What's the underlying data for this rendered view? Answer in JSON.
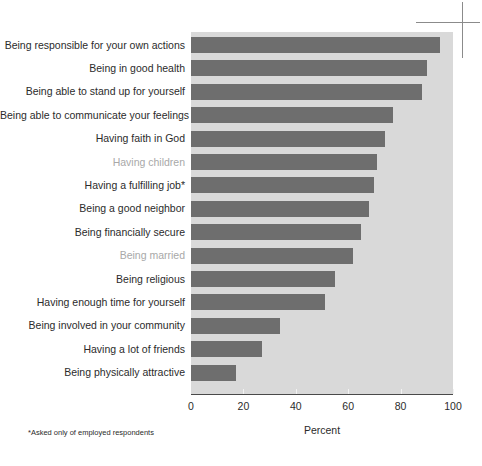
{
  "figure": {
    "x_axis_title": "Percent",
    "footnote": "*Asked only of employed respondents"
  },
  "chart_data": {
    "type": "bar",
    "orientation": "horizontal",
    "title": "",
    "subtitle": "",
    "xlabel": "Percent",
    "ylabel": "",
    "xlim": [
      0,
      100
    ],
    "xticks": [
      0,
      20,
      40,
      60,
      80,
      100
    ],
    "xticklabels": [
      "0",
      "20",
      "40",
      "60",
      "80",
      "100"
    ],
    "grid": false,
    "legend": null,
    "bar_color": "#6e6e6e",
    "panel_color": "#d9d9d9",
    "highlight_label_color": "#a8a8a8",
    "annotations": [
      "*Asked only of employed respondents"
    ],
    "categories": [
      "Being responsible for your own actions",
      "Being in good health",
      "Being able to stand up for yourself",
      "Being able to communicate your feelings",
      "Having faith in God",
      "Having children",
      "Having a fulfilling job*",
      "Being a good neighbor",
      "Being financially secure",
      "Being married",
      "Being religious",
      "Having enough time for yourself",
      "Being involved in your community",
      "Having a lot of friends",
      "Being physically attractive"
    ],
    "values": [
      95,
      90,
      88,
      77,
      74,
      71,
      70,
      68,
      65,
      62,
      55,
      51,
      34,
      27,
      17
    ],
    "muted_categories": [
      "Having children",
      "Being married"
    ]
  }
}
